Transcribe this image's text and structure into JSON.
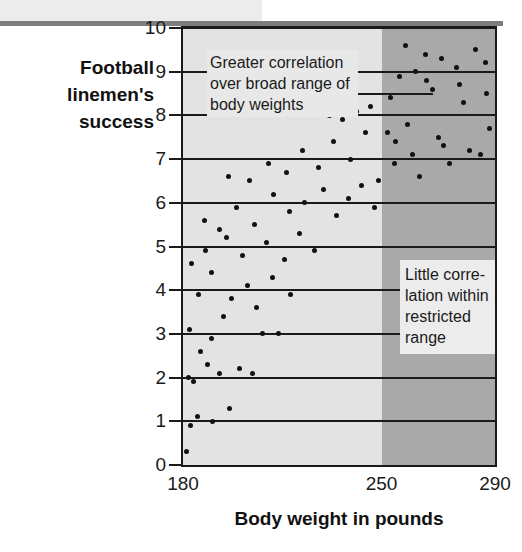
{
  "yaxis": {
    "title": "Football linemen's success",
    "ticks": [
      0,
      1,
      2,
      3,
      4,
      5,
      6,
      7,
      8,
      9,
      10
    ],
    "min": 0,
    "max": 10
  },
  "xaxis": {
    "title": "Body weight in pounds",
    "ticks": [
      180,
      250,
      290
    ],
    "min": 180,
    "max": 290
  },
  "annotations": {
    "broad": "Greater correlation over broad range of body weights",
    "restricted": "Little corre-lation within restricted range"
  },
  "colors": {
    "plot_background": "#e3e3e3",
    "restricted_background": "#a9a9a9",
    "dot": "#111111",
    "axis": "#1a1a1a",
    "top_band": "#ececec",
    "top_rule": "#7d7d7d"
  },
  "restricted_range": {
    "start": 250,
    "end": 290
  },
  "chart_data": {
    "type": "scatter",
    "title": "",
    "xlabel": "Body weight in pounds",
    "ylabel": "Football linemen's success",
    "xlim": [
      180,
      290
    ],
    "ylim": [
      0,
      10
    ],
    "xticks": [
      180,
      250,
      290
    ],
    "yticks": [
      0,
      1,
      2,
      3,
      4,
      5,
      6,
      7,
      8,
      9,
      10
    ],
    "grid": "horizontal",
    "legend": "none",
    "annotations": [
      {
        "text": "Greater correlation over broad range of body weights",
        "x": 195,
        "y": 9.2,
        "leader_lines": [
          {
            "from_x": 216,
            "to_x": 268,
            "y": 10.0
          },
          {
            "from_x": 238,
            "to_x": 268,
            "y": 8.5
          }
        ]
      },
      {
        "text": "Little corre-lation within restricted range",
        "x": 255,
        "y": 4.6
      }
    ],
    "series": [
      {
        "name": "Football linemen",
        "points": [
          [
            181.2,
            0.3
          ],
          [
            182.8,
            0.9
          ],
          [
            185.0,
            1.1
          ],
          [
            183.6,
            1.9
          ],
          [
            190.5,
            1.0
          ],
          [
            196.3,
            1.3
          ],
          [
            193.0,
            2.1
          ],
          [
            181.8,
            2.0
          ],
          [
            186.2,
            2.6
          ],
          [
            188.5,
            2.3
          ],
          [
            199.8,
            2.2
          ],
          [
            204.6,
            2.1
          ],
          [
            182.4,
            3.1
          ],
          [
            189.9,
            2.9
          ],
          [
            194.2,
            3.4
          ],
          [
            208.1,
            3.0
          ],
          [
            213.5,
            3.0
          ],
          [
            185.5,
            3.9
          ],
          [
            190.2,
            4.4
          ],
          [
            197.0,
            3.8
          ],
          [
            202.8,
            4.1
          ],
          [
            206.0,
            3.6
          ],
          [
            211.4,
            4.3
          ],
          [
            218.0,
            3.9
          ],
          [
            183.0,
            4.6
          ],
          [
            188.0,
            4.9
          ],
          [
            195.5,
            5.2
          ],
          [
            201.0,
            4.8
          ],
          [
            209.5,
            5.1
          ],
          [
            215.8,
            4.7
          ],
          [
            221.0,
            5.3
          ],
          [
            226.2,
            4.9
          ],
          [
            187.5,
            5.6
          ],
          [
            192.8,
            5.4
          ],
          [
            199.0,
            5.9
          ],
          [
            205.2,
            5.5
          ],
          [
            212.0,
            6.2
          ],
          [
            217.5,
            5.8
          ],
          [
            223.0,
            6.0
          ],
          [
            229.4,
            6.3
          ],
          [
            234.0,
            5.7
          ],
          [
            238.5,
            6.1
          ],
          [
            243.0,
            6.4
          ],
          [
            247.5,
            5.9
          ],
          [
            196.0,
            6.6
          ],
          [
            203.5,
            6.5
          ],
          [
            210.0,
            6.9
          ],
          [
            216.5,
            6.7
          ],
          [
            222.0,
            7.2
          ],
          [
            227.8,
            6.8
          ],
          [
            233.0,
            7.4
          ],
          [
            239.0,
            7.0
          ],
          [
            244.5,
            7.6
          ],
          [
            249.0,
            6.5
          ],
          [
            236.2,
            7.9
          ],
          [
            241.0,
            8.1
          ],
          [
            231.5,
            8.0
          ],
          [
            246.0,
            8.2
          ],
          [
            252.0,
            7.6
          ],
          [
            256.5,
            8.9
          ],
          [
            261.0,
            7.1
          ],
          [
            265.5,
            9.4
          ],
          [
            268.0,
            8.6
          ],
          [
            272.0,
            7.3
          ],
          [
            276.5,
            9.1
          ],
          [
            279.0,
            8.3
          ],
          [
            283.0,
            9.5
          ],
          [
            286.5,
            9.2
          ],
          [
            288.0,
            7.7
          ],
          [
            254.5,
            6.9
          ],
          [
            259.0,
            7.8
          ],
          [
            263.5,
            6.6
          ],
          [
            270.0,
            7.5
          ],
          [
            274.0,
            6.9
          ],
          [
            281.0,
            7.2
          ],
          [
            285.0,
            7.1
          ],
          [
            253.0,
            8.4
          ],
          [
            258.5,
            9.6
          ],
          [
            266.0,
            8.8
          ],
          [
            277.5,
            8.7
          ],
          [
            271.0,
            9.3
          ],
          [
            262.0,
            9.0
          ],
          [
            287.0,
            8.5
          ],
          [
            255.0,
            7.4
          ]
        ]
      }
    ]
  }
}
